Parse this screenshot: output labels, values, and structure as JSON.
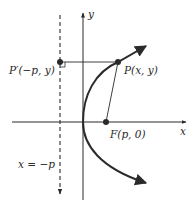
{
  "diagram": {
    "type": "parabola-focus-directrix",
    "axes": {
      "x_label": "x",
      "y_label": "y"
    },
    "points": {
      "P": {
        "label": "P(x, y)"
      },
      "P_prime": {
        "label": "P′(−p, y)"
      },
      "F": {
        "label": "F(p, 0)"
      }
    },
    "directrix": {
      "label": "x = −p",
      "style": "dashed"
    },
    "colors": {
      "stroke": "#2a2a2a",
      "background": "#ffffff"
    }
  }
}
